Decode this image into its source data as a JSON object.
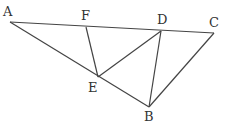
{
  "diagram": {
    "type": "geometry",
    "points": {
      "A": {
        "x": 10,
        "y": 22
      },
      "F": {
        "x": 86,
        "y": 27
      },
      "D": {
        "x": 161,
        "y": 31
      },
      "C": {
        "x": 214,
        "y": 33
      },
      "E": {
        "x": 98,
        "y": 77
      },
      "B": {
        "x": 149,
        "y": 107
      }
    },
    "segments": [
      [
        "A",
        "C"
      ],
      [
        "A",
        "B"
      ],
      [
        "C",
        "B"
      ],
      [
        "F",
        "E"
      ],
      [
        "E",
        "D"
      ],
      [
        "D",
        "B"
      ]
    ],
    "labels": [
      {
        "text": "A",
        "x": 3,
        "y": 16
      },
      {
        "text": "F",
        "x": 81,
        "y": 20
      },
      {
        "text": "D",
        "x": 157,
        "y": 24
      },
      {
        "text": "C",
        "x": 209,
        "y": 27
      },
      {
        "text": "E",
        "x": 88,
        "y": 92
      },
      {
        "text": "B",
        "x": 144,
        "y": 121
      }
    ]
  }
}
